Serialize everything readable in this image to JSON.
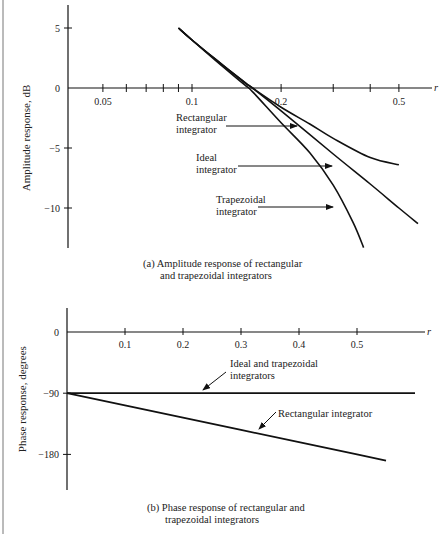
{
  "chart_data": [
    {
      "type": "line",
      "title": "(a) Amplitude response of rectangular and trapezoidal integrators",
      "caption_lines": [
        "(a)  Amplitude response of rectangular",
        "and trapezoidal integrators"
      ],
      "xlabel": "r",
      "ylabel": "Amplitude response, dB",
      "xscale": "log",
      "xlim": [
        0.038,
        0.6
      ],
      "ylim": [
        -13.3,
        7
      ],
      "x_tick_labels": [
        "0.05",
        "0.1",
        "0.2",
        "0.5"
      ],
      "x_minor_ticks": [
        0.05,
        0.06,
        0.07,
        0.08,
        0.09,
        0.1,
        0.2,
        0.3,
        0.4,
        0.5
      ],
      "y_tick_labels": [
        "5",
        "0",
        "−5",
        "−10"
      ],
      "y_ticks": [
        5,
        0,
        -5,
        -10
      ],
      "grid": false,
      "series": [
        {
          "name": "Rectangular integrator",
          "x": [
            0.09,
            0.1,
            0.12,
            0.15,
            0.16,
            0.2,
            0.25,
            0.3,
            0.4,
            0.5
          ],
          "values": [
            5.0,
            4.0,
            2.4,
            0.5,
            0.0,
            -1.6,
            -3.0,
            -4.2,
            -5.8,
            -6.4
          ]
        },
        {
          "name": "Ideal integrator",
          "x": [
            0.09,
            0.1,
            0.12,
            0.15,
            0.16,
            0.2,
            0.3,
            0.4,
            0.5,
            0.58
          ],
          "values": [
            5.0,
            4.0,
            2.4,
            0.5,
            0.0,
            -1.9,
            -5.5,
            -8.0,
            -10.0,
            -11.3
          ]
        },
        {
          "name": "Trapezoidal integrator",
          "x": [
            0.09,
            0.1,
            0.12,
            0.15,
            0.16,
            0.2,
            0.25,
            0.3,
            0.35,
            0.38
          ],
          "values": [
            5.0,
            4.0,
            2.3,
            0.3,
            -0.3,
            -2.9,
            -5.4,
            -8.1,
            -11.2,
            -13.3
          ]
        }
      ],
      "annotations": [
        {
          "text_lines": [
            "Rectangular",
            "integrator"
          ],
          "points_to": "Rectangular integrator"
        },
        {
          "text_lines": [
            "Ideal",
            "integrator"
          ],
          "points_to": "Ideal integrator"
        },
        {
          "text_lines": [
            "Trapezoidal",
            "integrator"
          ],
          "points_to": "Trapezoidal integrator"
        }
      ]
    },
    {
      "type": "line",
      "title": "(b) Phase response of rectangular and trapezoidal integrators",
      "caption_lines": [
        "(b)  Phase response of rectangular and",
        "trapezoidal integrators"
      ],
      "xlabel": "r",
      "ylabel": "Phase response, degrees",
      "xscale": "linear",
      "xlim": [
        0,
        0.6
      ],
      "ylim": [
        -225,
        40
      ],
      "x_tick_labels": [
        "0.1",
        "0.2",
        "0.3",
        "0.4",
        "0.5"
      ],
      "x_ticks": [
        0.1,
        0.2,
        0.3,
        0.4,
        0.5
      ],
      "y_tick_labels": [
        "0",
        "−90",
        "−180"
      ],
      "y_ticks": [
        0,
        -90,
        -180
      ],
      "grid": false,
      "series": [
        {
          "name": "Ideal and trapezoidal integrators",
          "x": [
            0,
            0.6
          ],
          "values": [
            -90,
            -90
          ]
        },
        {
          "name": "Rectangular integrator",
          "x": [
            0,
            0.1,
            0.2,
            0.3,
            0.4,
            0.5,
            0.55
          ],
          "values": [
            -90,
            -108,
            -126,
            -144,
            -162,
            -180,
            -189
          ]
        }
      ],
      "annotations": [
        {
          "text_lines": [
            "Ideal and trapezoidal",
            "integrators"
          ],
          "points_to": "Ideal and trapezoidal integrators"
        },
        {
          "text_lines": [
            "Rectangular integrator"
          ],
          "points_to": "Rectangular integrator"
        }
      ]
    }
  ]
}
